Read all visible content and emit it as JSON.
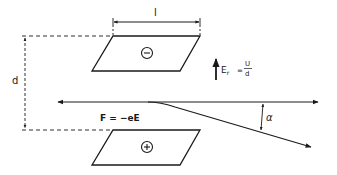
{
  "diagram": {
    "labels": {
      "plate_length": "l",
      "plate_distance": "d",
      "field_symbol": "E",
      "field_subscript": "r",
      "field_equals": "=",
      "field_numerator": "U",
      "field_denominator": "d",
      "force": "F = −eE",
      "angle": "α",
      "top_plate_sign": "⊖",
      "bottom_plate_sign": "⊕"
    },
    "colors": {
      "stroke": "#1a1a1a",
      "background": "#ffffff"
    }
  }
}
